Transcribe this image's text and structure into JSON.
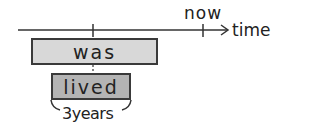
{
  "diagram": {
    "timeline": {
      "axis_label": "time",
      "now_label": "now",
      "colors": {
        "line": "#333333"
      }
    },
    "events": [
      {
        "label": "was",
        "fill": "#d8d8d8"
      },
      {
        "label": "lived",
        "fill": "#b4b4b4"
      }
    ],
    "duration_label": "3years"
  }
}
